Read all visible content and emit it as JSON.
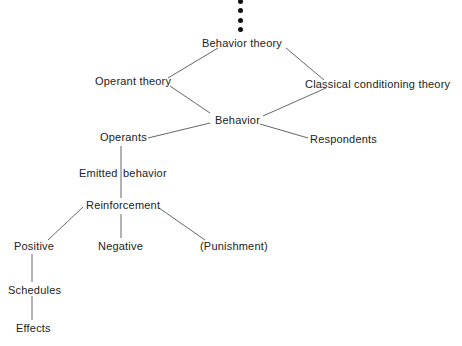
{
  "diagram": {
    "colors": {
      "line": "#555555",
      "text": "#222222",
      "dot": "#111111"
    },
    "ellipsis": "continuation-dots",
    "nodes": {
      "behavior_theory": "Behavior theory",
      "operant_theory": "Operant theory",
      "classical_theory": "Classical conditioning theory",
      "behavior": "Behavior",
      "operants": "Operants",
      "respondents": "Respondents",
      "emitted_behavior_a": "Emitted",
      "emitted_behavior_b": "behavior",
      "reinforcement": "Reinforcement",
      "positive": "Positive",
      "negative": "Negative",
      "punishment": "(Punishment)",
      "schedules": "Schedules",
      "effects": "Effects"
    },
    "edges": [
      [
        "Behavior theory",
        "Operant theory"
      ],
      [
        "Behavior theory",
        "Classical conditioning theory"
      ],
      [
        "Operant theory",
        "Behavior"
      ],
      [
        "Classical conditioning theory",
        "Behavior"
      ],
      [
        "Behavior",
        "Operants"
      ],
      [
        "Behavior",
        "Respondents"
      ],
      [
        "Operants",
        "Reinforcement"
      ],
      [
        "Reinforcement",
        "Positive"
      ],
      [
        "Reinforcement",
        "Negative"
      ],
      [
        "Reinforcement",
        "(Punishment)"
      ],
      [
        "Positive",
        "Schedules"
      ],
      [
        "Schedules",
        "Effects"
      ]
    ]
  }
}
